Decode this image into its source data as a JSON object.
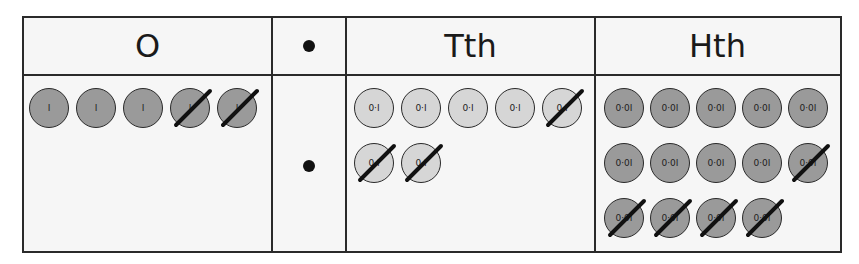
{
  "headers": {
    "ones": "O",
    "point": "•",
    "tenths": "Tth",
    "hundredths": "Hth"
  },
  "decimal_point_symbol": "•",
  "colors": {
    "ones_counter": "#9a9a9a",
    "tenths_counter": "#d6d6d6",
    "hundredths_counter": "#9a9a9a",
    "line": "#2a2a2a"
  },
  "ones": {
    "label": "I",
    "counters": [
      {
        "label": "I",
        "crossed": false
      },
      {
        "label": "I",
        "crossed": false
      },
      {
        "label": "I",
        "crossed": false
      },
      {
        "label": "I",
        "crossed": true
      },
      {
        "label": "I",
        "crossed": true
      }
    ]
  },
  "tenths": {
    "label": "0·I",
    "counters": [
      {
        "label": "0·I",
        "crossed": false
      },
      {
        "label": "0·I",
        "crossed": false
      },
      {
        "label": "0·I",
        "crossed": false
      },
      {
        "label": "0·I",
        "crossed": false
      },
      {
        "label": "0·I",
        "crossed": true
      },
      {
        "label": "0·I",
        "crossed": true
      },
      {
        "label": "0·I",
        "crossed": true
      }
    ]
  },
  "hundredths": {
    "label": "0·0I",
    "counters": [
      {
        "label": "0·0I",
        "crossed": false
      },
      {
        "label": "0·0I",
        "crossed": false
      },
      {
        "label": "0·0I",
        "crossed": false
      },
      {
        "label": "0·0I",
        "crossed": false
      },
      {
        "label": "0·0I",
        "crossed": false
      },
      {
        "label": "0·0I",
        "crossed": false
      },
      {
        "label": "0·0I",
        "crossed": false
      },
      {
        "label": "0·0I",
        "crossed": false
      },
      {
        "label": "0·0I",
        "crossed": false
      },
      {
        "label": "0·0I",
        "crossed": true
      },
      {
        "label": "0·0I",
        "crossed": true
      },
      {
        "label": "0·0I",
        "crossed": true
      },
      {
        "label": "0·0I",
        "crossed": true
      },
      {
        "label": "0·0I",
        "crossed": true
      }
    ]
  }
}
